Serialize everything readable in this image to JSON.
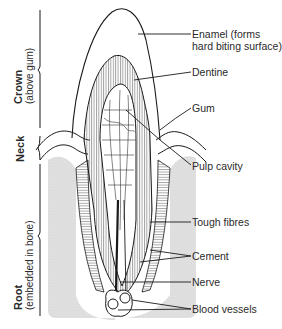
{
  "diagram": {
    "regions": [
      {
        "name": "Crown",
        "note": "(above gum)"
      },
      {
        "name": "Neck",
        "note": ""
      },
      {
        "name": "Root",
        "note": "(embedded in bone)"
      }
    ],
    "labels": [
      {
        "id": "enamel",
        "line1": "Enamel (forms",
        "line2": "hard biting surface)"
      },
      {
        "id": "dentine",
        "line1": "Dentine"
      },
      {
        "id": "gum",
        "line1": "Gum"
      },
      {
        "id": "pulp",
        "line1": "Pulp cavity"
      },
      {
        "id": "fibres",
        "line1": "Tough fibres"
      },
      {
        "id": "cement",
        "line1": "Cement"
      },
      {
        "id": "nerve",
        "line1": "Nerve"
      },
      {
        "id": "vessels",
        "line1": "Blood vessels"
      }
    ],
    "colors": {
      "line": "#1a1a1a",
      "bone": "#dcdcdc",
      "hatch": "#555555"
    }
  }
}
